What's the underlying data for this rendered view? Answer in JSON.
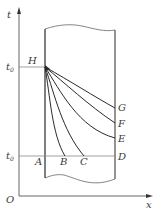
{
  "diagram": {
    "type": "temperature-time profile (cooling/solidification)",
    "axes": {
      "vertical_label": "t",
      "horizontal_label": "x",
      "origin_label": "O"
    },
    "levels": {
      "upper": {
        "label_base": "t",
        "label_sub": "0",
        "point": "H"
      },
      "lower": {
        "label_base": "t",
        "label_sub": "0",
        "points": [
          "A",
          "B",
          "C",
          "D"
        ]
      }
    },
    "points": {
      "H": "H",
      "G": "G",
      "F": "F",
      "E": "E",
      "D": "D",
      "A": "A",
      "B": "B",
      "C": "C"
    },
    "curves": [
      {
        "from": "H",
        "to": "G",
        "shape": "near-linear"
      },
      {
        "from": "H",
        "to": "F",
        "shape": "slightly concave"
      },
      {
        "from": "H",
        "to": "E",
        "shape": "concave"
      },
      {
        "from": "H",
        "to": "C",
        "shape": "steep concave"
      },
      {
        "from": "H",
        "to": "B",
        "shape": "steepest concave"
      }
    ],
    "colors": {
      "line": "#2a2a2a",
      "axis": "#555555",
      "guide": "#888888"
    }
  }
}
